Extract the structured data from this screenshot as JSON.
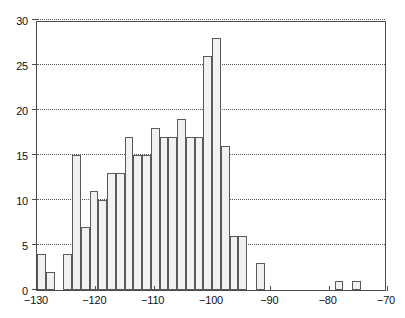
{
  "chart_data": {
    "type": "bar",
    "title": "",
    "subtitle": "",
    "xlabel": "",
    "ylabel": "",
    "xlim": [
      -130,
      -70
    ],
    "ylim": [
      0,
      30
    ],
    "bin_width": 1.5,
    "grid": true,
    "grid_axis": "y",
    "grid_style": "dotted",
    "legend": null,
    "legend_position": "none",
    "xticks": [
      -130,
      -120,
      -110,
      -100,
      -90,
      -80,
      -70
    ],
    "xtick_labels": [
      "−130",
      "−120",
      "−110",
      "−100",
      "−90",
      "−80",
      "−70"
    ],
    "yticks": [
      0,
      5,
      10,
      15,
      20,
      25,
      30
    ],
    "ytick_labels": [
      "0",
      "5",
      "10",
      "15",
      "20",
      "25",
      "30"
    ],
    "bin_edges": [
      -130.0,
      -128.5,
      -127.0,
      -125.5,
      -124.0,
      -122.5,
      -121.0,
      -119.5,
      -118.0,
      -116.5,
      -115.0,
      -113.5,
      -112.0,
      -110.5,
      -109.0,
      -107.5,
      -106.0,
      -104.5,
      -103.0,
      -101.5,
      -100.0,
      -98.5,
      -97.0,
      -95.5,
      -94.0,
      -92.5,
      -91.0,
      -89.5,
      -88.0,
      -86.5,
      -85.0,
      -83.5,
      -82.0,
      -80.5,
      -79.0,
      -77.5,
      -76.0,
      -74.5,
      -73.0,
      -71.5,
      -70.0
    ],
    "categories": [
      "-129.25",
      "-127.75",
      "-126.25",
      "-124.75",
      "-123.25",
      "-121.75",
      "-120.25",
      "-118.75",
      "-117.25",
      "-115.75",
      "-114.25",
      "-112.75",
      "-111.25",
      "-109.75",
      "-108.25",
      "-106.75",
      "-105.25",
      "-103.75",
      "-102.25",
      "-100.75",
      "-99.25",
      "-97.75",
      "-96.25",
      "-94.75",
      "-93.25",
      "-91.75",
      "-90.25",
      "-88.75",
      "-87.25",
      "-85.75",
      "-84.25",
      "-82.75",
      "-81.25",
      "-79.75",
      "-78.25",
      "-76.75",
      "-75.25",
      "-73.75",
      "-72.25",
      "-70.75"
    ],
    "values": [
      4,
      2,
      0,
      4,
      15,
      7,
      11,
      10,
      13,
      13,
      17,
      15,
      15,
      18,
      17,
      17,
      19,
      17,
      17,
      26,
      28,
      16,
      6,
      6,
      0,
      3,
      0,
      0,
      0,
      0,
      0,
      0,
      0,
      0,
      1,
      0,
      1,
      0,
      0,
      0
    ],
    "n_bins": 40,
    "max_value": 28,
    "max_value_bin": "-99.25",
    "colors": {
      "bar_fill": "#f1f1f1",
      "bar_edge": "#5a5a5a",
      "axis": "#4a4a4a",
      "grid": "#555555",
      "text": "#111111",
      "background": "#ffffff"
    }
  }
}
